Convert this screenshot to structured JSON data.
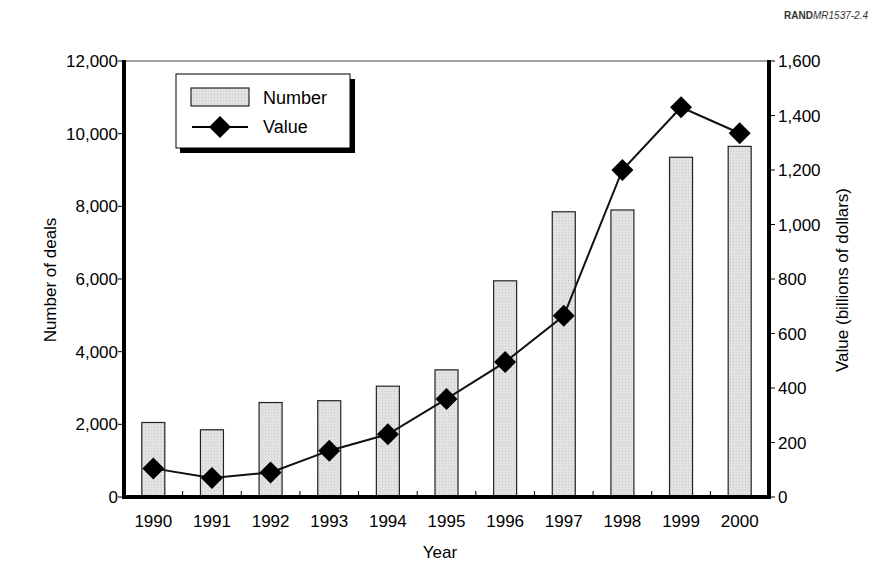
{
  "credit": {
    "org": "RAND",
    "doc_id": "MR1537-2.4"
  },
  "chart_data": {
    "type": "bar+line",
    "title": "",
    "xlabel": "Year",
    "ylabel": "Number of deals",
    "y2label": "Value (billions of dollars)",
    "categories": [
      "1990",
      "1991",
      "1992",
      "1993",
      "1994",
      "1995",
      "1996",
      "1997",
      "1998",
      "1999",
      "2000"
    ],
    "series": [
      {
        "name": "Number",
        "type": "bar",
        "axis": "left",
        "values": [
          2050,
          1850,
          2600,
          2650,
          3050,
          3500,
          5950,
          7850,
          7900,
          9350,
          9650
        ]
      },
      {
        "name": "Value",
        "type": "line",
        "axis": "right",
        "marker": "diamond",
        "values": [
          105,
          70,
          90,
          170,
          230,
          360,
          495,
          665,
          1200,
          1430,
          1335
        ]
      }
    ],
    "ylim": [
      0,
      12000
    ],
    "y2lim": [
      0,
      1600
    ],
    "yticks": [
      "0",
      "2,000",
      "4,000",
      "6,000",
      "8,000",
      "10,000",
      "12,000"
    ],
    "y2ticks": [
      "0",
      "200",
      "400",
      "600",
      "800",
      "1,000",
      "1,200",
      "1,400",
      "1,600"
    ],
    "grid": false,
    "legend": {
      "position": "upper-left",
      "entries": [
        "Number",
        "Value"
      ]
    }
  },
  "style": {
    "bar_fill": "#e2e2e2",
    "bar_stroke": "#222222",
    "line_color": "#111111",
    "axis_color": "#000000"
  }
}
